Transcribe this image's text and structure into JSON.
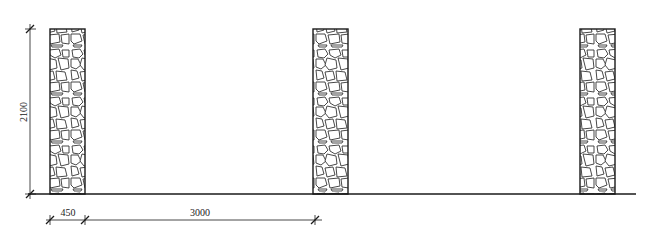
{
  "drawing": {
    "type": "elevation",
    "subject": "stone pillars",
    "colors": {
      "line": "#1a1a1a",
      "stone_outline": "#333333",
      "background": "#ffffff"
    },
    "dimensions": {
      "height": {
        "label": "2100",
        "orientation": "vertical"
      },
      "pillar_width": {
        "label": "450"
      },
      "spacing": {
        "label": "3000"
      }
    },
    "pillars": [
      {
        "id": "pillar-1",
        "x": 50,
        "width": 35
      },
      {
        "id": "pillar-2",
        "x": 313,
        "width": 35
      },
      {
        "id": "pillar-3",
        "x": 580,
        "width": 35
      }
    ],
    "geometry": {
      "top": 29,
      "ground": 194,
      "ground_start": 28,
      "ground_end": 636
    }
  }
}
